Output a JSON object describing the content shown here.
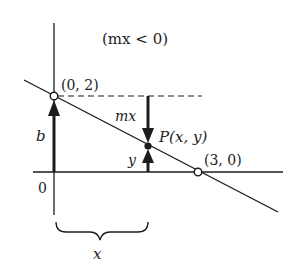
{
  "diagram": {
    "condition": "(mx < 0)",
    "point_intercept_label": "(0, 2)",
    "point_xintercept_label": "(3, 0)",
    "point_p_label": "P(x, y)",
    "label_b": "b",
    "label_mx": "mx",
    "label_y": "y",
    "label_origin": "0",
    "label_x_brace": "x",
    "colors": {
      "ink": "#1c1c1c",
      "background": "#ffffff"
    }
  }
}
